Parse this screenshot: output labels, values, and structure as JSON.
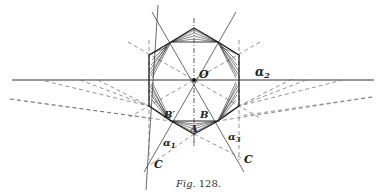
{
  "figure": {
    "caption_prefix": "Fig.",
    "caption_number": "128.",
    "labels": {
      "O": "O",
      "alpha2": "α",
      "alpha2_sub": "2",
      "alpha1": "α",
      "alpha1_sub": "1",
      "alpha3": "α",
      "alpha3_sub": "3",
      "B_prime": "B′",
      "B": "B",
      "A": "A",
      "C_left": "C",
      "C_right": "C"
    },
    "colors": {
      "ink": "#222222",
      "dash": "#777777",
      "background": "#ffffff"
    }
  }
}
